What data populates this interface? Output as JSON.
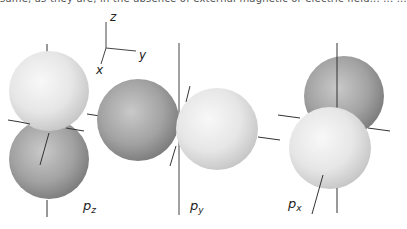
{
  "header": {
    "cut_text": "same, as they are, in the absence of external magnetic or electric field... ... ..."
  },
  "axes_indicator": {
    "z_label": "z",
    "y_label": "y",
    "x_label": "x"
  },
  "orbitals": [
    {
      "name": "p_z",
      "label_main": "p",
      "label_sub": "z",
      "orientation": "vertical"
    },
    {
      "name": "p_y",
      "label_main": "p",
      "label_sub": "y",
      "orientation": "horizontal"
    },
    {
      "name": "p_x",
      "label_main": "p",
      "label_sub": "x",
      "orientation": "depth"
    }
  ],
  "colors": {
    "light_lobe_center": "#f6f6f6",
    "light_lobe_edge": "#cfcfcf",
    "dark_lobe_center": "#bdbdbd",
    "dark_lobe_edge": "#7d7d7d",
    "axis_line": "#333333"
  }
}
